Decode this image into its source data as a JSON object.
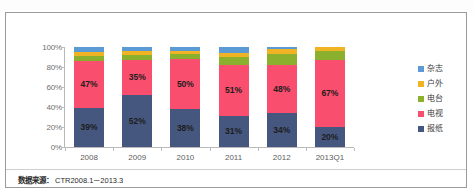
{
  "chart_data": {
    "type": "bar",
    "subtype": "100% stacked column",
    "title": "",
    "xlabel": "",
    "ylabel": "",
    "ylim": [
      0,
      100
    ],
    "ytick_labels": [
      "0%",
      "20%",
      "40%",
      "60%",
      "80%",
      "100%"
    ],
    "ytick_values": [
      0,
      20,
      40,
      60,
      80,
      100
    ],
    "grid": false,
    "legend_position": "right",
    "categories": [
      "2008",
      "2009",
      "2010",
      "2011",
      "2012",
      "2013Q1"
    ],
    "series": [
      {
        "name": "报纸",
        "color": "#46577f",
        "values": [
          39,
          52,
          38,
          31,
          34,
          20
        ],
        "labels": [
          "39%",
          "52%",
          "38%",
          "31%",
          "34%",
          "20%"
        ],
        "show_labels": true
      },
      {
        "name": "电视",
        "color": "#fa4e6e",
        "values": [
          47,
          35,
          50,
          51,
          48,
          67
        ],
        "labels": [
          "47%",
          "35%",
          "50%",
          "51%",
          "48%",
          "67%"
        ],
        "show_labels": true
      },
      {
        "name": "电台",
        "color": "#8ab02e",
        "values": [
          5,
          5,
          5,
          8,
          11,
          9
        ],
        "labels": [
          "",
          "",
          "",
          "",
          "",
          ""
        ],
        "show_labels": false
      },
      {
        "name": "户外",
        "color": "#f0b323",
        "values": [
          4,
          4,
          3,
          4,
          5,
          4
        ],
        "labels": [
          "",
          "",
          "",
          "",
          "",
          ""
        ],
        "show_labels": false
      },
      {
        "name": "杂志",
        "color": "#5b9bd5",
        "values": [
          5,
          4,
          4,
          6,
          2,
          0
        ],
        "labels": [
          "",
          "",
          "",
          "",
          "",
          ""
        ],
        "show_labels": false
      }
    ]
  },
  "legend": {
    "items": [
      {
        "label": "杂志",
        "color": "#5b9bd5"
      },
      {
        "label": "户外",
        "color": "#f0b323"
      },
      {
        "label": "电台",
        "color": "#8ab02e"
      },
      {
        "label": "电视",
        "color": "#fa4e6e"
      },
      {
        "label": "报纸",
        "color": "#46577f"
      }
    ]
  },
  "footer": {
    "label": "数据来源：",
    "value": "CTR2008.1－2013.3"
  }
}
